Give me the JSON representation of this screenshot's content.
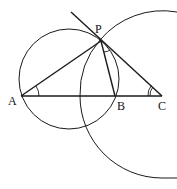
{
  "diagram": {
    "points": {
      "A": {
        "label": "A",
        "x": 21,
        "y": 96
      },
      "B": {
        "label": "B",
        "x": 115,
        "y": 96
      },
      "C": {
        "label": "C",
        "x": 162,
        "y": 96
      },
      "P": {
        "label": "P",
        "x": 101,
        "y": 41
      }
    },
    "segments": [
      "AP",
      "AC",
      "PB",
      "PC",
      "tangent line through P"
    ],
    "circles": [
      {
        "name": "circle through A, P, B",
        "cx": 69,
        "cy": 79,
        "r": 50
      },
      {
        "name": "arc centered at C through P",
        "cx": 162,
        "cy": 96,
        "r": 82
      }
    ],
    "angle_marks": [
      "angle at A (single arc)",
      "angle at P between PB and PC (single arc)",
      "angle at C (double arc)"
    ],
    "stroke_color": "#1a1a1a"
  }
}
